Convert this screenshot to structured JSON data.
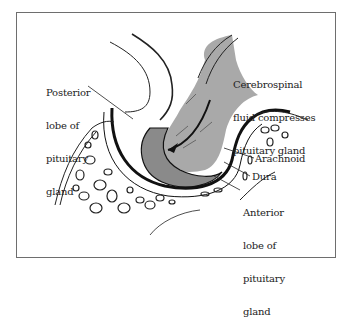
{
  "figure": {
    "labels": {
      "posterior_lobe": [
        "Posterior",
        "lobe of",
        "pituitary",
        "gland"
      ],
      "csf": [
        "Cerebrospinal",
        "fluid compresses",
        "pituitary gland"
      ],
      "arachnoid": "Arachnoid",
      "dura": "Dura",
      "anterior_lobe": [
        "Anterior",
        "lobe of",
        "pituitary",
        "gland"
      ]
    },
    "colors": {
      "frame": "#6e6e6e",
      "csf_fill": "#a9a9a9",
      "gland_fill": "#8a8a8a",
      "outline": "#111111",
      "background": "#ffffff"
    }
  }
}
